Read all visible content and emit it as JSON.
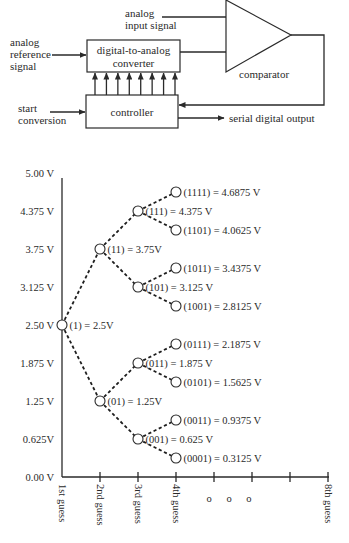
{
  "block_diagram": {
    "inputs": {
      "analog_input": [
        "analog",
        "input signal"
      ],
      "analog_reference": [
        "analog",
        "reference",
        "signal"
      ],
      "start_conversion": [
        "start",
        "conversion"
      ]
    },
    "blocks": {
      "dac": [
        "digital-to-analog",
        "converter"
      ],
      "controller": "controller",
      "comparator": "comparator"
    },
    "outputs": {
      "serial_output": "serial digital output"
    },
    "dac_input_lines": 8
  },
  "chart_data": {
    "type": "tree",
    "ylabel": "Voltage",
    "ylim": [
      0,
      5
    ],
    "y_ticks": [
      "5.00 V",
      "4.375 V",
      "3.75 V",
      "3.125 V",
      "2.50 V",
      "1.875 V",
      "1.25 V",
      "0.625V",
      "0.00 V"
    ],
    "y_tick_values": [
      5.0,
      4.375,
      3.75,
      3.125,
      2.5,
      1.875,
      1.25,
      0.625,
      0.0
    ],
    "x_ticks": [
      "1st guess",
      "2nd guess",
      "3rd guess",
      "4th guess",
      "",
      "",
      "",
      "8th guess"
    ],
    "ellipsis": "o o o",
    "nodes": [
      {
        "code": "(1)",
        "label": "(1) = 2.5V",
        "guess": 1,
        "value": 2.5
      },
      {
        "code": "(11)",
        "label": "(11) = 3.75V",
        "guess": 2,
        "value": 3.75
      },
      {
        "code": "(01)",
        "label": "(01) = 1.25V",
        "guess": 2,
        "value": 1.25
      },
      {
        "code": "(111)",
        "label": "(111) = 4.375 V",
        "guess": 3,
        "value": 4.375
      },
      {
        "code": "(101)",
        "label": "(101) = 3.125 V",
        "guess": 3,
        "value": 3.125
      },
      {
        "code": "(011)",
        "label": "(011) = 1.875 V",
        "guess": 3,
        "value": 1.875
      },
      {
        "code": "(001)",
        "label": "(001) = 0.625 V",
        "guess": 3,
        "value": 0.625
      },
      {
        "code": "(1111)",
        "label": "(1111) = 4.6875 V",
        "guess": 4,
        "value": 4.6875
      },
      {
        "code": "(1101)",
        "label": "(1101) = 4.0625 V",
        "guess": 4,
        "value": 4.0625
      },
      {
        "code": "(1011)",
        "label": "(1011) = 3.4375 V",
        "guess": 4,
        "value": 3.4375
      },
      {
        "code": "(1001)",
        "label": "(1001) = 2.8125 V",
        "guess": 4,
        "value": 2.8125
      },
      {
        "code": "(0111)",
        "label": "(0111) = 2.1875 V",
        "guess": 4,
        "value": 2.1875
      },
      {
        "code": "(0101)",
        "label": "(0101) = 1.5625 V",
        "guess": 4,
        "value": 1.5625
      },
      {
        "code": "(0011)",
        "label": "(0011) = 0.9375 V",
        "guess": 4,
        "value": 0.9375
      },
      {
        "code": "(0001)",
        "label": "(0001) = 0.3125 V",
        "guess": 4,
        "value": 0.3125
      }
    ],
    "edges": [
      [
        "(1)",
        "(11)"
      ],
      [
        "(1)",
        "(01)"
      ],
      [
        "(11)",
        "(111)"
      ],
      [
        "(11)",
        "(101)"
      ],
      [
        "(01)",
        "(011)"
      ],
      [
        "(01)",
        "(001)"
      ],
      [
        "(111)",
        "(1111)"
      ],
      [
        "(111)",
        "(1101)"
      ],
      [
        "(101)",
        "(1011)"
      ],
      [
        "(101)",
        "(1001)"
      ],
      [
        "(011)",
        "(0111)"
      ],
      [
        "(011)",
        "(0101)"
      ],
      [
        "(001)",
        "(0011)"
      ],
      [
        "(001)",
        "(0001)"
      ]
    ]
  }
}
